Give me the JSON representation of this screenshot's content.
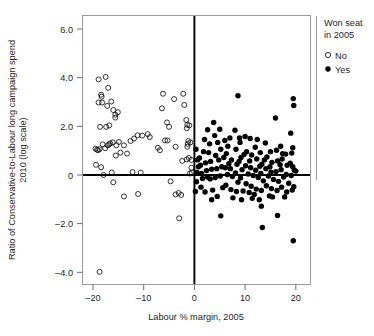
{
  "chart_data": {
    "type": "scatter",
    "title": "",
    "xlabel": "Labour % margin, 2005",
    "ylabel": "Ratio of Conservative-to-Labour long campaign spend 2010 (log scale)",
    "ylabel_line1": "Ratio of Conservative-to-Labour long campaign spend",
    "ylabel_line2": "2010 (log scale)",
    "xlim": [
      -22.5,
      23.0
    ],
    "ylim": [
      -4.6,
      6.6
    ],
    "xticks": [
      -20,
      -10,
      0,
      10,
      20
    ],
    "xtick_labels": [
      "–20",
      "–10",
      "0",
      "10",
      "20"
    ],
    "yticks": [
      6,
      4,
      2,
      0,
      -2,
      -4
    ],
    "ytick_labels": [
      "6.0",
      "4.0",
      "2.0",
      "0",
      "–2.0",
      "–4.0"
    ],
    "grid": false,
    "reference_lines": {
      "horizontal_y": 0,
      "vertical_x": 0,
      "color": "#000000"
    },
    "legend": {
      "position": "right",
      "title": "Won seat in 2005",
      "title_line1": "Won seat",
      "title_line2": "in 2005",
      "entries": [
        {
          "label": "No",
          "marker": "open-circle",
          "color": "#111111"
        },
        {
          "label": "Yes",
          "marker": "filled-circle",
          "color": "#000000"
        }
      ]
    },
    "series": [
      {
        "name": "No",
        "marker": "open-circle",
        "points": [
          [
            -18.9,
            3.93
          ],
          [
            -17.5,
            4.03
          ],
          [
            -17.0,
            3.58
          ],
          [
            -18.3,
            3.22
          ],
          [
            -18.4,
            3.3
          ],
          [
            -18.9,
            2.98
          ],
          [
            -17.2,
            2.84
          ],
          [
            -16.4,
            3.02
          ],
          [
            -16.0,
            2.67
          ],
          [
            -15.1,
            2.58
          ],
          [
            -15.6,
            2.36
          ],
          [
            -15.6,
            2.48
          ],
          [
            -17.4,
            1.98
          ],
          [
            -18.6,
            1.98
          ],
          [
            -16.8,
            2.04
          ],
          [
            -16.1,
            1.34
          ],
          [
            -16.6,
            1.3
          ],
          [
            -17.1,
            1.22
          ],
          [
            -18.1,
            1.26
          ],
          [
            -19.2,
            1.04
          ],
          [
            -19.5,
            1.08
          ],
          [
            -18.7,
            1.06
          ],
          [
            -17.6,
            1.1
          ],
          [
            -14.9,
            1.36
          ],
          [
            -13.9,
            1.22
          ],
          [
            -14.6,
            0.92
          ],
          [
            -15.5,
            0.8
          ],
          [
            -12.6,
            1.4
          ],
          [
            -11.9,
            1.5
          ],
          [
            -11.2,
            1.63
          ],
          [
            -10.3,
            1.62
          ],
          [
            -9.2,
            1.68
          ],
          [
            -8.8,
            1.56
          ],
          [
            -7.2,
            1.12
          ],
          [
            -6.8,
            1.02
          ],
          [
            -6.2,
            3.34
          ],
          [
            -6.4,
            2.74
          ],
          [
            -5.4,
            2.16
          ],
          [
            -5.0,
            1.98
          ],
          [
            -5.3,
            1.42
          ],
          [
            -4.0,
            3.12
          ],
          [
            -3.7,
            1.16
          ],
          [
            -2.2,
            3.34
          ],
          [
            -2.0,
            2.88
          ],
          [
            -1.6,
            2.26
          ],
          [
            -1.4,
            2.06
          ],
          [
            -1.5,
            1.92
          ],
          [
            -1.2,
            1.4
          ],
          [
            -1.3,
            1.28
          ],
          [
            -1.4,
            1.16
          ],
          [
            -1.1,
            0.7
          ],
          [
            -1.5,
            0.64
          ],
          [
            -0.6,
            0.62
          ],
          [
            -0.6,
            0.3
          ],
          [
            -0.5,
            0.1
          ],
          [
            -19.4,
            0.42
          ],
          [
            -18.4,
            0.32
          ],
          [
            -17.9,
            0.0
          ],
          [
            -16.3,
            0.1
          ],
          [
            -12.2,
            0.12
          ],
          [
            -16.0,
            -0.3
          ],
          [
            -13.9,
            -0.88
          ],
          [
            -11.1,
            -0.78
          ],
          [
            -4.7,
            -0.26
          ],
          [
            -3.7,
            -0.8
          ],
          [
            -3.1,
            -0.74
          ],
          [
            -2.6,
            -0.82
          ],
          [
            -3.0,
            -1.78
          ],
          [
            -18.7,
            -3.98
          ],
          [
            -19.0,
            1.02
          ],
          [
            -16.8,
            1.26
          ],
          [
            -13.3,
            0.88
          ],
          [
            -2.4,
            0.58
          ],
          [
            -1.0,
            2.04
          ],
          [
            -0.8,
            1.34
          ],
          [
            -18.2,
            2.98
          ],
          [
            -15.4,
            1.22
          ],
          [
            -10.6,
            0.1
          ],
          [
            -5.8,
            1.42
          ],
          [
            -0.9,
            0.06
          ]
        ]
      },
      {
        "name": "Yes",
        "marker": "filled-circle",
        "points": [
          [
            0.3,
            1.06
          ],
          [
            0.6,
            0.62
          ],
          [
            0.5,
            0.1
          ],
          [
            0.4,
            -0.28
          ],
          [
            0.2,
            -0.68
          ],
          [
            1.0,
            0.7
          ],
          [
            1.2,
            0.4
          ],
          [
            1.4,
            0.06
          ],
          [
            1.6,
            -0.14
          ],
          [
            1.3,
            -0.5
          ],
          [
            2.0,
            1.46
          ],
          [
            2.2,
            0.5
          ],
          [
            2.4,
            0.18
          ],
          [
            2.6,
            -0.08
          ],
          [
            2.1,
            -0.7
          ],
          [
            3.0,
            1.28
          ],
          [
            3.2,
            0.56
          ],
          [
            3.4,
            0.24
          ],
          [
            3.1,
            -0.16
          ],
          [
            3.6,
            -0.62
          ],
          [
            3.8,
            2.16
          ],
          [
            4.0,
            1.62
          ],
          [
            4.2,
            0.8
          ],
          [
            4.4,
            0.26
          ],
          [
            4.1,
            -0.1
          ],
          [
            4.5,
            -0.88
          ],
          [
            5.0,
            1.88
          ],
          [
            5.2,
            1.06
          ],
          [
            5.4,
            0.34
          ],
          [
            5.1,
            -0.04
          ],
          [
            5.6,
            -0.52
          ],
          [
            5.2,
            -1.68
          ],
          [
            6.0,
            1.42
          ],
          [
            6.3,
            0.88
          ],
          [
            6.1,
            0.3
          ],
          [
            6.5,
            0.02
          ],
          [
            6.2,
            -0.42
          ],
          [
            7.0,
            1.52
          ],
          [
            7.3,
            0.62
          ],
          [
            7.1,
            0.26
          ],
          [
            7.5,
            -0.06
          ],
          [
            7.2,
            -0.6
          ],
          [
            8.0,
            1.84
          ],
          [
            8.2,
            1.06
          ],
          [
            8.4,
            0.44
          ],
          [
            8.1,
            0.08
          ],
          [
            8.6,
            -0.3
          ],
          [
            8.3,
            -0.68
          ],
          [
            8.6,
            3.26
          ],
          [
            9.0,
            1.34
          ],
          [
            9.2,
            0.72
          ],
          [
            9.4,
            0.22
          ],
          [
            9.1,
            -0.12
          ],
          [
            9.6,
            -0.66
          ],
          [
            9.3,
            -1.02
          ],
          [
            10.0,
            1.58
          ],
          [
            10.3,
            0.96
          ],
          [
            10.1,
            0.38
          ],
          [
            10.6,
            0.04
          ],
          [
            10.2,
            -0.36
          ],
          [
            10.8,
            -0.72
          ],
          [
            11.0,
            1.5
          ],
          [
            11.3,
            0.82
          ],
          [
            11.1,
            0.3
          ],
          [
            11.6,
            -0.02
          ],
          [
            11.2,
            -0.46
          ],
          [
            11.8,
            -0.8
          ],
          [
            12.0,
            1.14
          ],
          [
            12.3,
            0.66
          ],
          [
            12.1,
            0.2
          ],
          [
            12.6,
            -0.1
          ],
          [
            12.2,
            -0.58
          ],
          [
            12.8,
            -1.02
          ],
          [
            13.0,
            0.92
          ],
          [
            13.3,
            0.44
          ],
          [
            13.1,
            0.06
          ],
          [
            13.6,
            -0.24
          ],
          [
            13.2,
            -0.64
          ],
          [
            13.4,
            -2.16
          ],
          [
            13.2,
            -1.28
          ],
          [
            14.0,
            1.32
          ],
          [
            14.3,
            0.74
          ],
          [
            14.1,
            0.26
          ],
          [
            14.6,
            -0.04
          ],
          [
            14.2,
            -0.44
          ],
          [
            14.8,
            -0.86
          ],
          [
            15.0,
            0.96
          ],
          [
            15.3,
            0.52
          ],
          [
            15.1,
            0.12
          ],
          [
            15.6,
            -0.18
          ],
          [
            15.2,
            -0.56
          ],
          [
            16.0,
            2.34
          ],
          [
            16.2,
            1.02
          ],
          [
            16.4,
            0.58
          ],
          [
            16.1,
            0.14
          ],
          [
            16.6,
            -0.26
          ],
          [
            16.3,
            -0.64
          ],
          [
            16.4,
            -1.66
          ],
          [
            17.0,
            1.18
          ],
          [
            17.3,
            0.66
          ],
          [
            17.1,
            0.22
          ],
          [
            17.6,
            -0.08
          ],
          [
            17.2,
            -0.5
          ],
          [
            17.8,
            -0.9
          ],
          [
            18.0,
            0.86
          ],
          [
            18.3,
            0.4
          ],
          [
            18.1,
            0.02
          ],
          [
            18.6,
            -0.34
          ],
          [
            18.2,
            -0.7
          ],
          [
            19.0,
            1.72
          ],
          [
            19.2,
            0.9
          ],
          [
            19.4,
            0.34
          ],
          [
            19.1,
            -0.02
          ],
          [
            19.6,
            -0.48
          ],
          [
            19.3,
            -0.62
          ],
          [
            19.5,
            3.14
          ],
          [
            19.6,
            2.86
          ],
          [
            19.4,
            1.12
          ],
          [
            19.7,
            0.2
          ],
          [
            19.5,
            -2.7
          ],
          [
            2.8,
            0.92
          ],
          [
            4.8,
            0.62
          ],
          [
            6.8,
            0.46
          ],
          [
            8.8,
            0.56
          ],
          [
            10.9,
            0.58
          ],
          [
            12.9,
            0.36
          ],
          [
            14.9,
            0.34
          ],
          [
            16.9,
            0.42
          ],
          [
            18.9,
            0.48
          ],
          [
            3.4,
            -1.02
          ],
          [
            7.6,
            -0.94
          ],
          [
            11.4,
            -0.96
          ],
          [
            15.4,
            -0.9
          ],
          [
            6.6,
            1.18
          ],
          [
            2.6,
            1.86
          ],
          [
            1.8,
            0.96
          ],
          [
            0.8,
            0.34
          ],
          [
            5.8,
            0.72
          ],
          [
            9.8,
            0.84
          ],
          [
            13.8,
            0.62
          ],
          [
            17.4,
            0.88
          ],
          [
            12.4,
            1.46
          ],
          [
            8.9,
            1.52
          ],
          [
            4.6,
            1.34
          ],
          [
            20.0,
            0.16
          ]
        ]
      }
    ]
  }
}
